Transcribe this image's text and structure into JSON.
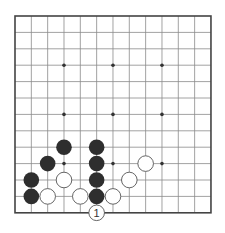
{
  "board": {
    "columns": 13,
    "rows": 13,
    "origin_x": 15,
    "origin_y": 16,
    "spacing_x": 16.33,
    "spacing_y": 16.4,
    "line_color": "#8a8a8a",
    "border_color": "#444444",
    "star_points": [
      [
        3,
        3
      ],
      [
        6,
        3
      ],
      [
        9,
        3
      ],
      [
        3,
        6
      ],
      [
        6,
        6
      ],
      [
        9,
        6
      ],
      [
        3,
        9
      ],
      [
        6,
        9
      ],
      [
        9,
        9
      ]
    ],
    "stones": [
      {
        "color": "black",
        "col": 3,
        "row": 8
      },
      {
        "color": "black",
        "col": 5,
        "row": 8
      },
      {
        "color": "black",
        "col": 2,
        "row": 9
      },
      {
        "color": "black",
        "col": 5,
        "row": 9
      },
      {
        "color": "black",
        "col": 1,
        "row": 10
      },
      {
        "color": "black",
        "col": 5,
        "row": 10
      },
      {
        "color": "black",
        "col": 1,
        "row": 11
      },
      {
        "color": "black",
        "col": 5,
        "row": 11
      },
      {
        "color": "white",
        "col": 8,
        "row": 9
      },
      {
        "color": "white",
        "col": 3,
        "row": 10
      },
      {
        "color": "white",
        "col": 7,
        "row": 10
      },
      {
        "color": "white",
        "col": 2,
        "row": 11
      },
      {
        "color": "white",
        "col": 4,
        "row": 11
      },
      {
        "color": "white",
        "col": 6,
        "row": 11
      },
      {
        "color": "white",
        "col": 5,
        "row": 12,
        "label": "1"
      }
    ],
    "colors": {
      "black_stone": "#2e2e2e",
      "white_stone": "#ffffff",
      "white_stone_outline": "#555555",
      "star_point": "#333333"
    }
  }
}
